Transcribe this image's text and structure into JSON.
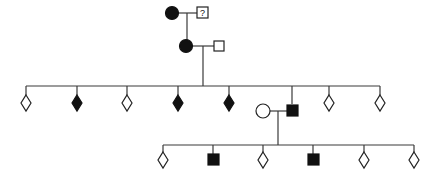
{
  "diagram": {
    "type": "pedigree",
    "colors": {
      "affected": "#111111",
      "unaffected": "#ffffff",
      "line": "#3a3a3a"
    },
    "generation_1": {
      "female": {
        "shape": "circle",
        "status": "affected",
        "label": ""
      },
      "male": {
        "shape": "square",
        "status": "unknown",
        "label": "?"
      }
    },
    "generation_2": {
      "female": {
        "shape": "circle",
        "status": "affected",
        "label": ""
      },
      "male": {
        "shape": "square",
        "status": "unaffected",
        "label": ""
      }
    },
    "generation_3": {
      "children": [
        {
          "shape": "diamond",
          "status": "unaffected"
        },
        {
          "shape": "diamond",
          "status": "affected"
        },
        {
          "shape": "diamond",
          "status": "unaffected"
        },
        {
          "shape": "diamond",
          "status": "affected"
        },
        {
          "shape": "diamond",
          "status": "affected"
        },
        {
          "shape": "square",
          "status": "affected",
          "spouse": {
            "shape": "circle",
            "status": "unaffected"
          }
        },
        {
          "shape": "diamond",
          "status": "unaffected"
        },
        {
          "shape": "diamond",
          "status": "unaffected"
        }
      ]
    },
    "generation_4": {
      "children": [
        {
          "shape": "diamond",
          "status": "unaffected"
        },
        {
          "shape": "square",
          "status": "affected"
        },
        {
          "shape": "diamond",
          "status": "unaffected"
        },
        {
          "shape": "square",
          "status": "affected"
        },
        {
          "shape": "diamond",
          "status": "unaffected"
        },
        {
          "shape": "diamond",
          "status": "unaffected"
        }
      ]
    }
  }
}
